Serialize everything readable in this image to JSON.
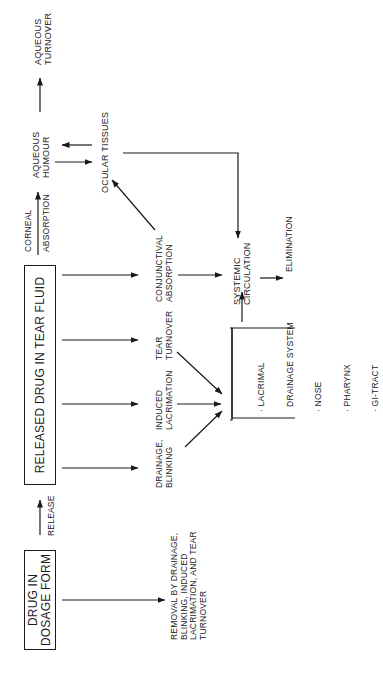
{
  "diagram": {
    "nodes": {
      "dosage_form": {
        "lines": [
          "DRUG IN",
          "DOSAGE FORM"
        ]
      },
      "released_drug": {
        "lines": [
          "RELEASED DRUG IN TEAR FLUID"
        ]
      },
      "aqueous_humour": {
        "lines": [
          "AQUEOUS",
          "HUMOUR"
        ]
      },
      "aqueous_turnover": {
        "lines": [
          "AQUEOUS",
          "TURNOVER"
        ]
      },
      "ocular_tissues": {
        "lines": [
          "OCULAR TISSUES"
        ]
      },
      "drainage_blinking": {
        "lines": [
          "DRAINAGE,",
          "BLINKING"
        ]
      },
      "induced_lacrimation": {
        "lines": [
          "INDUCED",
          "LACRIMATION"
        ]
      },
      "tear_turnover": {
        "lines": [
          "TEAR",
          "TURNOVER"
        ]
      },
      "conjunctival_absorption": {
        "lines": [
          "CONJUNCTIVAL",
          "ABSORPTION"
        ]
      },
      "systemic_circulation": {
        "lines": [
          "SYSTEMIC",
          "CIRCULATION"
        ]
      },
      "elimination": {
        "lines": [
          "ELIMINATION"
        ]
      },
      "removal": {
        "lines": [
          "REMOVAL BY DRAINAGE,",
          "BLINKING, INDUCED",
          "LACRIMATION, AND TEAR",
          "TURNOVER"
        ]
      },
      "lacrimal_group": {
        "lines": [
          "· LACRIMAL",
          "  DRAINAGE SYSTEM",
          "· NOSE",
          "· PHARYNX",
          "· GI-TRACT"
        ]
      }
    },
    "edge_labels": {
      "release": "RELEASE",
      "corneal_absorption": [
        "CORNEAL",
        "ABSORPTION"
      ]
    },
    "edges": [
      {
        "from": "dosage_form",
        "to": "released_drug",
        "label": "RELEASE"
      },
      {
        "from": "dosage_form",
        "to": "removal"
      },
      {
        "from": "released_drug",
        "to": "aqueous_humour",
        "label": "CORNEAL ABSORPTION"
      },
      {
        "from": "aqueous_humour",
        "to": "aqueous_turnover"
      },
      {
        "from": "aqueous_humour",
        "to": "ocular_tissues"
      },
      {
        "from": "ocular_tissues",
        "to": "aqueous_humour"
      },
      {
        "from": "released_drug",
        "to": "drainage_blinking"
      },
      {
        "from": "released_drug",
        "to": "induced_lacrimation"
      },
      {
        "from": "released_drug",
        "to": "tear_turnover"
      },
      {
        "from": "released_drug",
        "to": "conjunctival_absorption"
      },
      {
        "from": "drainage_blinking",
        "to": "lacrimal_group"
      },
      {
        "from": "induced_lacrimation",
        "to": "lacrimal_group"
      },
      {
        "from": "tear_turnover",
        "to": "lacrimal_group"
      },
      {
        "from": "conjunctival_absorption",
        "to": "ocular_tissues"
      },
      {
        "from": "conjunctival_absorption",
        "to": "systemic_circulation"
      },
      {
        "from": "ocular_tissues",
        "to": "systemic_circulation"
      },
      {
        "from": "lacrimal_group",
        "to": "systemic_circulation"
      },
      {
        "from": "systemic_circulation",
        "to": "elimination"
      }
    ],
    "orientation": "rotated 90° counter-clockwise"
  }
}
